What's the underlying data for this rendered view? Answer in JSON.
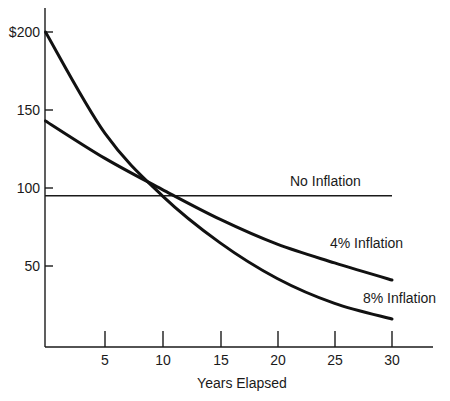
{
  "chart_data": {
    "type": "line",
    "title": "",
    "xlabel": "Years Elapsed",
    "ylabel": "",
    "x": [
      0,
      5,
      10,
      15,
      20,
      25,
      30
    ],
    "xlim": [
      0,
      33
    ],
    "ylim": [
      0,
      215
    ],
    "x_ticks": [
      5,
      10,
      15,
      20,
      25,
      30
    ],
    "x_tick_labels": [
      "5",
      "10",
      "15",
      "20",
      "25",
      "30"
    ],
    "y_ticks": [
      50,
      100,
      150,
      200
    ],
    "y_tick_labels": [
      "50",
      "100",
      "150",
      "$200"
    ],
    "grid": false,
    "legend": "inline labels at right end of each curve",
    "series": [
      {
        "name": "No Inflation",
        "values": [
          95,
          95,
          95,
          95,
          95,
          95,
          95
        ]
      },
      {
        "name": "4% Inflation",
        "values": [
          143,
          119,
          99,
          80,
          64,
          52,
          41
        ]
      },
      {
        "name": "8% Inflation",
        "values": [
          200,
          135,
          95,
          65,
          42,
          26,
          16
        ]
      }
    ]
  },
  "labels": {
    "xlabel": "Years Elapsed",
    "y_ticks": [
      "$200",
      "150",
      "100",
      "50"
    ],
    "x_ticks": [
      "5",
      "10",
      "15",
      "20",
      "25",
      "30"
    ],
    "series": [
      "No Inflation",
      "4% Inflation",
      "8% Inflation"
    ]
  },
  "colors": {
    "line": "#111111",
    "background": "#ffffff"
  }
}
